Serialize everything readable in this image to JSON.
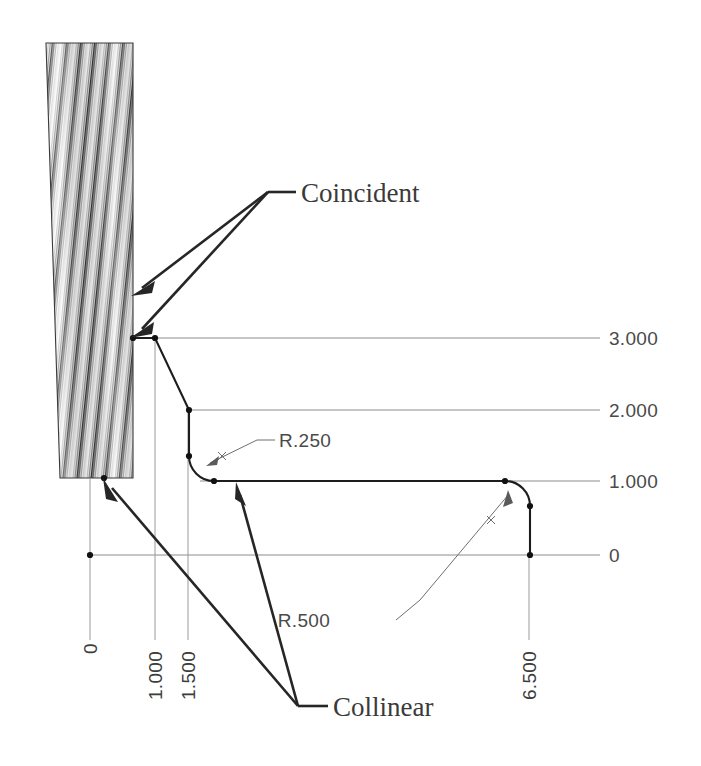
{
  "drawing": {
    "title": "Sketch profile with constraints",
    "background_color": "#ffffff",
    "line_color": "#1d1d1d",
    "dim_color": "#8c8c8c",
    "text_color": "#3a3a3a"
  },
  "vertical_dimensions": [
    {
      "label": "3.000",
      "value": 3.0
    },
    {
      "label": "2.000",
      "value": 2.0
    },
    {
      "label": "1.000",
      "value": 1.0
    },
    {
      "label": "0",
      "value": 0.0
    }
  ],
  "horizontal_dimensions": [
    {
      "label": "0",
      "value": 0.0
    },
    {
      "label": "1.000",
      "value": 1.0
    },
    {
      "label": "1.500",
      "value": 1.5
    },
    {
      "label": "6.500",
      "value": 6.5
    }
  ],
  "radii": [
    {
      "label": "R.250",
      "value": 0.25
    },
    {
      "label": "R.500",
      "value": 0.5
    }
  ],
  "annotations": [
    {
      "label": "Coincident",
      "arrow_count": 2
    },
    {
      "label": "Collinear",
      "arrow_count": 2
    }
  ],
  "hatch_region": {
    "name": "wall-section-hatch",
    "description": "section hatching"
  }
}
